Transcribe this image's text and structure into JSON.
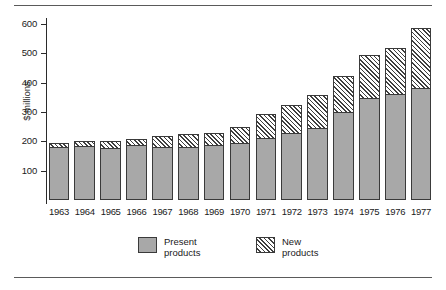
{
  "chart_data": {
    "type": "bar",
    "subtype": "stacked-vertical",
    "title": "",
    "xlabel": "",
    "ylabel": "$ millions",
    "ylim": [
      0,
      620
    ],
    "yticks": [
      100,
      200,
      300,
      400,
      500,
      600
    ],
    "ytick_labels": [
      "100",
      "200",
      "300",
      "400",
      "500",
      "600"
    ],
    "grid": false,
    "legend_position": "bottom-center",
    "categories": [
      "1963",
      "1964",
      "1965",
      "1966",
      "1967",
      "1968",
      "1969",
      "1970",
      "1971",
      "1972",
      "1973",
      "1974",
      "1975",
      "1976",
      "1977"
    ],
    "series": [
      {
        "name": "Present products",
        "color": "#a8a8a8",
        "fill": "solid-grey",
        "values": [
          180,
          183,
          178,
          188,
          181,
          182,
          186,
          195,
          210,
          228,
          244,
          299,
          346,
          361,
          383
        ]
      },
      {
        "name": "New products",
        "color": "#ffffff",
        "fill": "diagonal-hatch",
        "values": [
          18,
          21,
          25,
          22,
          40,
          48,
          46,
          58,
          88,
          100,
          116,
          127,
          153,
          160,
          207
        ]
      }
    ],
    "totals": [
      198,
      204,
      203,
      210,
      221,
      230,
      232,
      253,
      298,
      328,
      360,
      426,
      499,
      521,
      590
    ]
  },
  "legend": {
    "items": [
      {
        "swatch": "grey-square",
        "line1": "Present",
        "line2": "products"
      },
      {
        "swatch": "hatched-square",
        "line1": "New",
        "line2": "products"
      }
    ]
  }
}
